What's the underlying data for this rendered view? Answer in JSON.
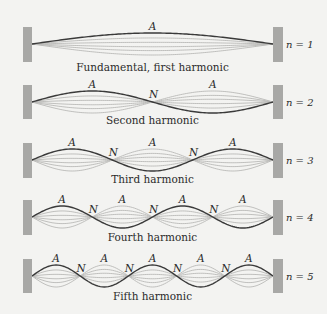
{
  "figure": {
    "background": "#f3f3f1",
    "colors": {
      "wall": "#a8a8a6",
      "string_dark": "#3a3a3a",
      "string_light": "#b9b9b7",
      "text": "#2b2b2b"
    },
    "string_x_start": 32,
    "string_x_end": 273,
    "amplitude_px": 11,
    "light_amplitude_fractions": [
      0.55,
      0.15,
      -0.25,
      -0.6,
      -1.0
    ],
    "antinode_label": "A",
    "node_label": "N",
    "harmonics": [
      {
        "n": 1,
        "n_label": "n = 1",
        "caption": "Fundamental, first harmonic",
        "center_y": 44,
        "wall_top": 27,
        "wall_bottom": 62,
        "caption_y": 71
      },
      {
        "n": 2,
        "n_label": "n = 2",
        "caption": "Second harmonic",
        "center_y": 102,
        "wall_top": 85,
        "wall_bottom": 119,
        "caption_y": 124
      },
      {
        "n": 3,
        "n_label": "n = 3",
        "caption": "Third harmonic",
        "center_y": 160,
        "wall_top": 143,
        "wall_bottom": 178,
        "caption_y": 183
      },
      {
        "n": 4,
        "n_label": "n = 4",
        "caption": "Fourth harmonic",
        "center_y": 217,
        "wall_top": 200,
        "wall_bottom": 235,
        "caption_y": 241
      },
      {
        "n": 5,
        "n_label": "n = 5",
        "caption": "Fifth harmonic",
        "center_y": 276,
        "wall_top": 259,
        "wall_bottom": 293,
        "caption_y": 300
      }
    ]
  }
}
